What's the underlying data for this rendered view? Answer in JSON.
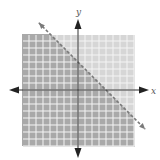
{
  "chart_data": {
    "type": "inequality-graph",
    "title": "",
    "xlabel": "x",
    "ylabel": "y",
    "xlim": [
      -8,
      8
    ],
    "ylim": [
      -8,
      8
    ],
    "grid": true,
    "grid_step": 1,
    "boundary_line": {
      "equation": "x + y = 4",
      "slope": -1,
      "y_intercept": 4,
      "x_intercept": 4,
      "style": "dashed"
    },
    "inequality": "x + y < 4",
    "shaded_region": "below-left of line",
    "colors": {
      "shaded": "#a9a9a9",
      "unshaded": "#d6d6d6",
      "grid": "#f2f2f2",
      "axis": "#333333",
      "line": "#777777"
    }
  },
  "labels": {
    "x_axis": "x",
    "y_axis": "y"
  }
}
